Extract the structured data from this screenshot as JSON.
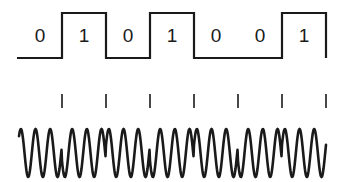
{
  "diagram": {
    "bits": [
      "0",
      "1",
      "0",
      "1",
      "0",
      "0",
      "1"
    ],
    "bit_width_px": 44,
    "start_x_px": 18,
    "digital_signal": {
      "low_y": 58,
      "high_y": 13,
      "end_drop_y": 58
    },
    "boundary_ticks": {
      "top_y": 94,
      "bottom_y": 108
    },
    "carrier_wave": {
      "center_y": 153,
      "amplitude_px": 24,
      "cycles_per_bit": 3,
      "phase_flip_at_each_boundary": true,
      "start_x_px": 19,
      "end_x_px": 326
    },
    "colors": {
      "line": "#1a1a1a",
      "background": "#ffffff"
    }
  }
}
